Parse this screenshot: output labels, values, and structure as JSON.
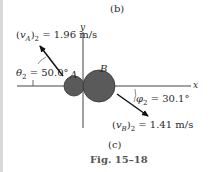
{
  "figure": {
    "sublabel_top": "(b)",
    "sublabel_bottom": "(c)",
    "caption": "Fig. 15–18"
  },
  "axes": {
    "x_label": "x",
    "y_label": "y"
  },
  "bodies": {
    "a_label": "A",
    "b_label": "B",
    "color": "#555555"
  },
  "vectors": {
    "vA": {
      "label_left": "(",
      "symbol": "v",
      "subscript": "A",
      "close": ")",
      "index": "2",
      "value": " = 1.96 m/s",
      "angle_symbol": "θ",
      "angle_index": "2",
      "angle_value": " = 50.0°"
    },
    "vB": {
      "label_left": "(",
      "symbol": "v",
      "subscript": "B",
      "close": ")",
      "index": "2",
      "value": " = 1.41 m/s",
      "angle_symbol": "φ",
      "angle_index": "2",
      "angle_value": " = 30.1°"
    }
  }
}
